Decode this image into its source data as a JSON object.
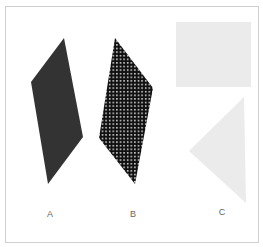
{
  "figure": {
    "shapes": [
      {
        "id": "A",
        "type": "parallelogram",
        "fill": "solid-dark",
        "color": "#333333",
        "points": "64,38 83,137 48,184 31,82"
      },
      {
        "id": "B",
        "type": "parallelogram",
        "fill": "dot-pattern",
        "color": "#111111",
        "dot_color": "#ffffff",
        "points": "115,38 153,88 135,184 99,138"
      },
      {
        "id": "C-rect",
        "type": "rectangle",
        "fill": "light-gray",
        "color": "#ebebeb",
        "x": 176,
        "y": 22,
        "width": 75,
        "height": 65
      },
      {
        "id": "C-triangle",
        "type": "triangle",
        "fill": "light-gray",
        "color": "#ebebeb",
        "points": "244,97 246,203 189,151"
      }
    ],
    "labels": [
      {
        "text": "A",
        "x": 50,
        "y": 214
      },
      {
        "text": "B",
        "x": 133,
        "y": 214
      },
      {
        "text": "C",
        "x": 222,
        "y": 212
      }
    ]
  }
}
